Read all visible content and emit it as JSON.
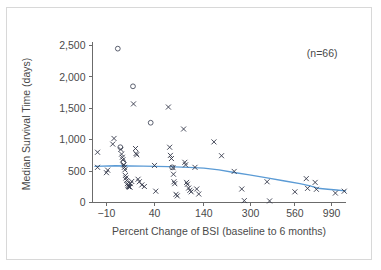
{
  "figure": {
    "background_color": "#ffffff",
    "frame_color": "#d8d8d8"
  },
  "chart_data": {
    "type": "scatter",
    "title": "",
    "xlabel": "Percent Change of BSI  (baseline to 6 months)",
    "ylabel": "Median Survival Time (days)",
    "annotation": "(n=66)",
    "grid": false,
    "legend": "none",
    "ylim": [
      0,
      2500
    ],
    "yticks": [
      0,
      500,
      1000,
      1500,
      2000,
      2500
    ],
    "ytick_labels": [
      "0",
      "500",
      "1,000",
      "1,500",
      "2,000",
      "2,500"
    ],
    "xtick_labels": [
      "-10",
      "40",
      "140",
      "300",
      "560",
      "990"
    ],
    "xtick_values": [
      -10,
      40,
      140,
      300,
      560,
      990
    ],
    "x_scale": "non-linear (log-like, compressed at high values)",
    "marker_styles": [
      "x",
      "open-circle"
    ],
    "trend_line": {
      "name": "smoothed trend",
      "color": "#5b9bd5",
      "points": [
        {
          "xp": 0.01,
          "y": 575
        },
        {
          "xp": 0.09,
          "y": 585
        },
        {
          "xp": 0.2,
          "y": 580
        },
        {
          "xp": 0.3,
          "y": 572
        },
        {
          "xp": 0.38,
          "y": 560
        },
        {
          "xp": 0.44,
          "y": 548
        },
        {
          "xp": 0.5,
          "y": 520
        },
        {
          "xp": 0.56,
          "y": 478
        },
        {
          "xp": 0.62,
          "y": 440
        },
        {
          "xp": 0.69,
          "y": 392
        },
        {
          "xp": 0.76,
          "y": 342
        },
        {
          "xp": 0.82,
          "y": 300
        },
        {
          "xp": 0.86,
          "y": 265
        },
        {
          "xp": 0.89,
          "y": 228
        },
        {
          "xp": 0.93,
          "y": 212
        },
        {
          "xp": 0.965,
          "y": 198
        },
        {
          "xp": 1.0,
          "y": 185
        }
      ]
    },
    "points": [
      {
        "xp": 0.02,
        "y": 800,
        "m": "x"
      },
      {
        "xp": 0.02,
        "y": 560,
        "m": "x"
      },
      {
        "xp": 0.055,
        "y": 475,
        "m": "x"
      },
      {
        "xp": 0.06,
        "y": 515,
        "m": "x"
      },
      {
        "xp": 0.08,
        "y": 930,
        "m": "x"
      },
      {
        "xp": 0.085,
        "y": 1020,
        "m": "x"
      },
      {
        "xp": 0.1,
        "y": 2450,
        "m": "o"
      },
      {
        "xp": 0.11,
        "y": 880,
        "m": "o"
      },
      {
        "xp": 0.112,
        "y": 845,
        "m": "x"
      },
      {
        "xp": 0.115,
        "y": 770,
        "m": "x"
      },
      {
        "xp": 0.118,
        "y": 720,
        "m": "x"
      },
      {
        "xp": 0.12,
        "y": 680,
        "m": "x"
      },
      {
        "xp": 0.122,
        "y": 640,
        "m": "o"
      },
      {
        "xp": 0.124,
        "y": 600,
        "m": "x"
      },
      {
        "xp": 0.126,
        "y": 560,
        "m": "x"
      },
      {
        "xp": 0.128,
        "y": 520,
        "m": "x"
      },
      {
        "xp": 0.13,
        "y": 430,
        "m": "x"
      },
      {
        "xp": 0.132,
        "y": 390,
        "m": "x"
      },
      {
        "xp": 0.135,
        "y": 350,
        "m": "x"
      },
      {
        "xp": 0.138,
        "y": 300,
        "m": "x"
      },
      {
        "xp": 0.14,
        "y": 270,
        "m": "x"
      },
      {
        "xp": 0.142,
        "y": 255,
        "m": "x"
      },
      {
        "xp": 0.145,
        "y": 250,
        "m": "x"
      },
      {
        "xp": 0.148,
        "y": 245,
        "m": "x"
      },
      {
        "xp": 0.15,
        "y": 300,
        "m": "x"
      },
      {
        "xp": 0.155,
        "y": 335,
        "m": "x"
      },
      {
        "xp": 0.16,
        "y": 1850,
        "m": "o"
      },
      {
        "xp": 0.162,
        "y": 1570,
        "m": "x"
      },
      {
        "xp": 0.17,
        "y": 860,
        "m": "x"
      },
      {
        "xp": 0.172,
        "y": 780,
        "m": "x"
      },
      {
        "xp": 0.175,
        "y": 760,
        "m": "x"
      },
      {
        "xp": 0.18,
        "y": 370,
        "m": "x"
      },
      {
        "xp": 0.185,
        "y": 330,
        "m": "x"
      },
      {
        "xp": 0.195,
        "y": 280,
        "m": "x"
      },
      {
        "xp": 0.205,
        "y": 255,
        "m": "x"
      },
      {
        "xp": 0.23,
        "y": 1270,
        "m": "o"
      },
      {
        "xp": 0.245,
        "y": 590,
        "m": "x"
      },
      {
        "xp": 0.25,
        "y": 180,
        "m": "x"
      },
      {
        "xp": 0.3,
        "y": 1520,
        "m": "x"
      },
      {
        "xp": 0.305,
        "y": 880,
        "m": "x"
      },
      {
        "xp": 0.308,
        "y": 750,
        "m": "x"
      },
      {
        "xp": 0.312,
        "y": 700,
        "m": "x"
      },
      {
        "xp": 0.315,
        "y": 560,
        "m": "o"
      },
      {
        "xp": 0.318,
        "y": 555,
        "m": "x"
      },
      {
        "xp": 0.32,
        "y": 450,
        "m": "x"
      },
      {
        "xp": 0.322,
        "y": 330,
        "m": "x"
      },
      {
        "xp": 0.325,
        "y": 300,
        "m": "x"
      },
      {
        "xp": 0.33,
        "y": 130,
        "m": "x"
      },
      {
        "xp": 0.335,
        "y": 105,
        "m": "x"
      },
      {
        "xp": 0.36,
        "y": 1170,
        "m": "x"
      },
      {
        "xp": 0.365,
        "y": 640,
        "m": "x"
      },
      {
        "xp": 0.368,
        "y": 600,
        "m": "x"
      },
      {
        "xp": 0.372,
        "y": 320,
        "m": "x"
      },
      {
        "xp": 0.375,
        "y": 290,
        "m": "x"
      },
      {
        "xp": 0.38,
        "y": 230,
        "m": "x"
      },
      {
        "xp": 0.385,
        "y": 195,
        "m": "x"
      },
      {
        "xp": 0.39,
        "y": 170,
        "m": "x"
      },
      {
        "xp": 0.405,
        "y": 560,
        "m": "x"
      },
      {
        "xp": 0.412,
        "y": 215,
        "m": "x"
      },
      {
        "xp": 0.42,
        "y": 135,
        "m": "x"
      },
      {
        "xp": 0.48,
        "y": 965,
        "m": "x"
      },
      {
        "xp": 0.51,
        "y": 745,
        "m": "x"
      },
      {
        "xp": 0.56,
        "y": 495,
        "m": "x"
      },
      {
        "xp": 0.59,
        "y": 215,
        "m": "x"
      },
      {
        "xp": 0.6,
        "y": 30,
        "m": "x"
      },
      {
        "xp": 0.69,
        "y": 330,
        "m": "x"
      },
      {
        "xp": 0.7,
        "y": 25,
        "m": "x"
      },
      {
        "xp": 0.8,
        "y": 170,
        "m": "x"
      },
      {
        "xp": 0.845,
        "y": 380,
        "m": "x"
      },
      {
        "xp": 0.85,
        "y": 225,
        "m": "x"
      },
      {
        "xp": 0.88,
        "y": 320,
        "m": "x"
      },
      {
        "xp": 0.885,
        "y": 210,
        "m": "x"
      },
      {
        "xp": 0.96,
        "y": 150,
        "m": "x"
      },
      {
        "xp": 0.995,
        "y": 180,
        "m": "x"
      }
    ]
  }
}
